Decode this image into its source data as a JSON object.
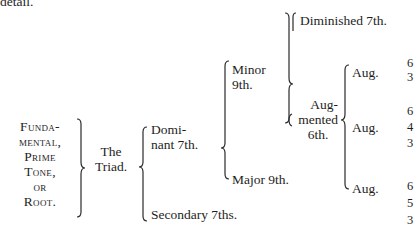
{
  "header_fragment": "detail.",
  "root": {
    "lines": [
      "Funda-",
      "mental,",
      "Prime",
      "Tone,",
      "or",
      "Root."
    ]
  },
  "triad": {
    "lines": [
      "The",
      "Triad."
    ]
  },
  "dominant": {
    "lines": [
      "Domi-",
      "nant 7th."
    ]
  },
  "secondary": "Secondary 7ths.",
  "minor9": {
    "lines": [
      "Minor",
      "9th."
    ]
  },
  "major9": "Major 9th.",
  "diminished7": "Diminished 7th.",
  "aug6th": {
    "lines": [
      "Aug-",
      "mented",
      "6th."
    ]
  },
  "aug_chords": [
    {
      "label": "Aug.",
      "figures": [
        "6",
        "3"
      ]
    },
    {
      "label": "Aug.",
      "figures": [
        "6",
        "4",
        "3"
      ]
    },
    {
      "label": "Aug.",
      "figures": [
        "6",
        "5",
        "3"
      ]
    }
  ]
}
